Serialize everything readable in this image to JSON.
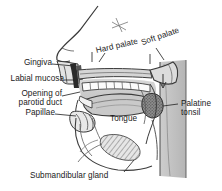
{
  "figure": {
    "background_color": "#ffffff",
    "ink_color": "#1a1a1a",
    "width": 222,
    "height": 191
  },
  "labels": {
    "gingiva": "Gingiva",
    "labial_mucosa": "Labial mucosa",
    "opening_of": "Opening of",
    "parotid_duct": "parotid duct",
    "papillae": "Papillae",
    "tongue": "Tongue",
    "hard_palate": "Hard palate",
    "soft_palate": "Soft palate",
    "palatine": "Palatine",
    "tonsil": "tonsil",
    "submandibular_gland": "Submandibular gland"
  },
  "structures": {
    "nose_profile": "nose-and-upper-lip-profile",
    "hard_palate_roof": "hard-palate-roof",
    "soft_palate_uvula": "soft-palate-and-uvula",
    "upper_teeth": "upper-tooth-row",
    "lower_teeth": "lower-tooth-row",
    "tongue_body": "tongue-body",
    "palatine_tonsil_mass": "palatine-tonsil-stippled-mass",
    "submandibular_gland_mass": "submandibular-gland-hatched-mass",
    "pharynx_wall": "posterior-pharyngeal-wall",
    "mandible_outline": "mandible-outline",
    "marker_asterisk": "nasal-asterisk-marker",
    "uvula_arrow": "uvula-direction-arrow"
  },
  "shading": {
    "mucosa_gray": "#b9b9b9",
    "cavity_gray": "#cfcfcf",
    "deep_gray": "#9a9a9a",
    "tonsil_gray": "#6f6f6f",
    "pharynx_gray": "#c4c4c4",
    "tooth_white": "#fbfbfb"
  }
}
